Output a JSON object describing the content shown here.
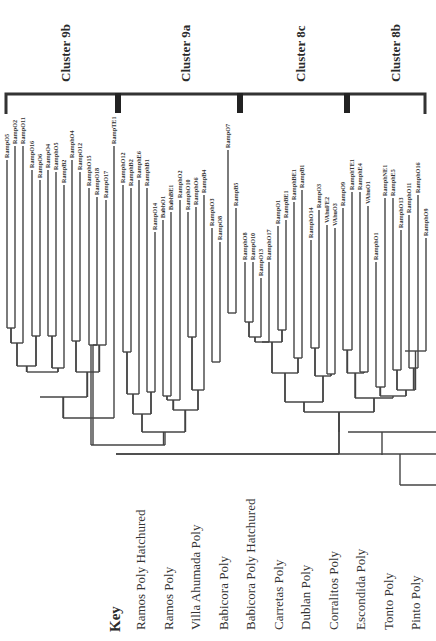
{
  "figure": {
    "clusters": [
      {
        "label": "Cluster 9b",
        "x": 65
      },
      {
        "label": "Cluster 9a",
        "x": 185
      },
      {
        "label": "Cluster 8c",
        "x": 300
      },
      {
        "label": "Cluster 8b",
        "x": 395
      }
    ],
    "bracket": {
      "x_start": 6,
      "x_end": 425,
      "y": 94,
      "dividers": [
        118,
        240,
        347
      ]
    },
    "leaves": [
      {
        "label": "RampO5",
        "x": 7,
        "top": 160
      },
      {
        "label": "RampO2",
        "x": 15,
        "top": 146
      },
      {
        "label": "RampO11",
        "x": 23,
        "top": 146
      },
      {
        "label": "RampO16",
        "x": 32,
        "top": 170
      },
      {
        "label": "RampO6",
        "x": 40,
        "top": 180
      },
      {
        "label": "RampO4",
        "x": 48,
        "top": 170
      },
      {
        "label": "RamphO5",
        "x": 56,
        "top": 172
      },
      {
        "label": "RampB2",
        "x": 64,
        "top": 185
      },
      {
        "label": "RamphO4",
        "x": 72,
        "top": 160
      },
      {
        "label": "RampO12",
        "x": 80,
        "top": 172
      },
      {
        "label": "RamphO15",
        "x": 89,
        "top": 188
      },
      {
        "label": "RampO18",
        "x": 97,
        "top": 197
      },
      {
        "label": "RampO17",
        "x": 106,
        "top": 200
      },
      {
        "label": "RampTE1",
        "x": 114,
        "top": 146
      },
      {
        "label": "RamphO12",
        "x": 123,
        "top": 185
      },
      {
        "label": "RamphB2",
        "x": 131,
        "top": 188
      },
      {
        "label": "RamphE6",
        "x": 139,
        "top": 180
      },
      {
        "label": "RamphB1",
        "x": 147,
        "top": 188
      },
      {
        "label": "RampO14",
        "x": 155,
        "top": 232
      },
      {
        "label": "BabhO1",
        "x": 163,
        "top": 220
      },
      {
        "label": "BabhBE1",
        "x": 171,
        "top": 212
      },
      {
        "label": "RamphO2",
        "x": 180,
        "top": 200
      },
      {
        "label": "RamphO10",
        "x": 188,
        "top": 212
      },
      {
        "label": "RamphO6",
        "x": 196,
        "top": 207
      },
      {
        "label": "RampB4",
        "x": 204,
        "top": 195
      },
      {
        "label": "RamphO3",
        "x": 212,
        "top": 228
      },
      {
        "label": "RampO8",
        "x": 220,
        "top": 242
      },
      {
        "label": "RampO7",
        "x": 228,
        "top": 150
      },
      {
        "label": "RampB5",
        "x": 236,
        "top": 208
      },
      {
        "label": "RamphO8",
        "x": 245,
        "top": 262
      },
      {
        "label": "RampO10",
        "x": 253,
        "top": 262
      },
      {
        "label": "RampO13",
        "x": 261,
        "top": 278
      },
      {
        "label": "RamphO17",
        "x": 269,
        "top": 262
      },
      {
        "label": "RampO1",
        "x": 278,
        "top": 226
      },
      {
        "label": "RampBE1",
        "x": 286,
        "top": 220
      },
      {
        "label": "RamphBE1",
        "x": 294,
        "top": 202
      },
      {
        "label": "RampB1",
        "x": 302,
        "top": 190
      },
      {
        "label": "RamphO14",
        "x": 311,
        "top": 240
      },
      {
        "label": "RampO3",
        "x": 319,
        "top": 210
      },
      {
        "label": "VAhuFE2",
        "x": 327,
        "top": 225
      },
      {
        "label": "VAhuO3",
        "x": 335,
        "top": 228
      },
      {
        "label": "RampO9",
        "x": 343,
        "top": 208
      },
      {
        "label": "RamphTE1",
        "x": 352,
        "top": 192
      },
      {
        "label": "RamphE4",
        "x": 360,
        "top": 192
      },
      {
        "label": "VAhuO1",
        "x": 368,
        "top": 206
      },
      {
        "label": "RamphO1",
        "x": 376,
        "top": 262
      },
      {
        "label": "RamphNE1",
        "x": 385,
        "top": 198
      },
      {
        "label": "RamphE5",
        "x": 393,
        "top": 198
      },
      {
        "label": "RamphO13",
        "x": 401,
        "top": 230
      },
      {
        "label": "RamphO11",
        "x": 409,
        "top": 215
      },
      {
        "label": "RamphO16",
        "x": 418,
        "top": 195
      },
      {
        "label": "RamphO9",
        "x": 426,
        "top": 238
      }
    ],
    "merges": [
      {
        "x1": 7,
        "x2": 15,
        "y": 328
      },
      {
        "x1": 11,
        "x2": 23,
        "y": 343
      },
      {
        "x1": 32,
        "x2": 40,
        "y": 336
      },
      {
        "x1": 17,
        "x2": 36,
        "y": 366
      },
      {
        "x1": 48,
        "x2": 56,
        "y": 336
      },
      {
        "x1": 52,
        "x2": 64,
        "y": 368
      },
      {
        "x1": 72,
        "x2": 80,
        "y": 341
      },
      {
        "x1": 89,
        "x2": 97,
        "y": 345
      },
      {
        "x1": 93,
        "x2": 106,
        "y": 345
      },
      {
        "x1": 76,
        "x2": 99,
        "y": 372
      },
      {
        "x1": 27,
        "x2": 58,
        "y": 372
      },
      {
        "x1": 40,
        "x2": 87,
        "y": 397
      },
      {
        "x1": 63,
        "x2": 114,
        "y": 418
      },
      {
        "x1": 123,
        "x2": 131,
        "y": 352
      },
      {
        "x1": 127,
        "x2": 139,
        "y": 394
      },
      {
        "x1": 147,
        "x2": 155,
        "y": 392
      },
      {
        "x1": 163,
        "x2": 171,
        "y": 396
      },
      {
        "x1": 167,
        "x2": 180,
        "y": 400
      },
      {
        "x1": 133,
        "x2": 151,
        "y": 414
      },
      {
        "x1": 188,
        "x2": 196,
        "y": 337
      },
      {
        "x1": 192,
        "x2": 204,
        "y": 390
      },
      {
        "x1": 173,
        "x2": 198,
        "y": 410
      },
      {
        "x1": 212,
        "x2": 220,
        "y": 362
      },
      {
        "x1": 228,
        "x2": 236,
        "y": 313
      },
      {
        "x1": 142,
        "x2": 185,
        "y": 432
      },
      {
        "x1": 91,
        "x2": 165,
        "y": 445
      },
      {
        "x1": 245,
        "x2": 253,
        "y": 322
      },
      {
        "x1": 249,
        "x2": 261,
        "y": 337
      },
      {
        "x1": 255,
        "x2": 269,
        "y": 342
      },
      {
        "x1": 278,
        "x2": 286,
        "y": 330
      },
      {
        "x1": 262,
        "x2": 282,
        "y": 342
      },
      {
        "x1": 294,
        "x2": 302,
        "y": 358
      },
      {
        "x1": 272,
        "x2": 298,
        "y": 373
      },
      {
        "x1": 311,
        "x2": 319,
        "y": 348
      },
      {
        "x1": 327,
        "x2": 335,
        "y": 374
      },
      {
        "x1": 315,
        "x2": 331,
        "y": 376
      },
      {
        "x1": 285,
        "x2": 323,
        "y": 402
      },
      {
        "x1": 343,
        "x2": 352,
        "y": 350
      },
      {
        "x1": 360,
        "x2": 368,
        "y": 372
      },
      {
        "x1": 347,
        "x2": 364,
        "y": 373
      },
      {
        "x1": 376,
        "x2": 385,
        "y": 387
      },
      {
        "x1": 393,
        "x2": 401,
        "y": 370
      },
      {
        "x1": 409,
        "x2": 418,
        "y": 368
      },
      {
        "x1": 405,
        "x2": 426,
        "y": 351
      },
      {
        "x1": 397,
        "x2": 415,
        "y": 390
      },
      {
        "x1": 380,
        "x2": 406,
        "y": 396
      },
      {
        "x1": 355,
        "x2": 393,
        "y": 398
      },
      {
        "x1": 304,
        "x2": 374,
        "y": 412
      },
      {
        "x1": 116,
        "x2": 339,
        "y": 454
      }
    ],
    "root_lines": [
      {
        "x1": 348,
        "x2": 436,
        "y": 432
      },
      {
        "x1": 116,
        "x2": 436,
        "y": 454
      },
      {
        "x1": 400,
        "x2": 436,
        "y": 485
      }
    ],
    "root_verticals": [
      {
        "x": 339,
        "y1": 412,
        "y2": 432
      },
      {
        "x": 382,
        "y1": 432,
        "y2": 455
      },
      {
        "x": 400,
        "y1": 454,
        "y2": 485
      }
    ]
  },
  "key": {
    "title": "Key",
    "items": [
      "Ramos Poly Hatchured",
      "Ramos Poly",
      "Villa Ahumada Poly",
      "Babicora Poly",
      "Babicora Poly Hatchured",
      "Carretas Poly",
      "Dublan Poly",
      "Corralitos Poly",
      "Escondida Poly",
      "Tonto Poly",
      "Pinto Poly"
    ]
  }
}
